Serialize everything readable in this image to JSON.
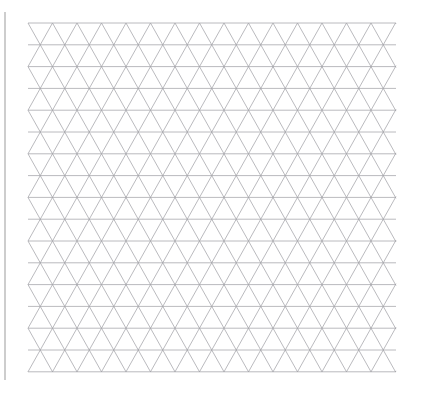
{
  "page": {
    "width": 425,
    "height": 398,
    "background_color": "#ffffff"
  },
  "binding_edge": {
    "name": "page-binding-edge",
    "color": "#b8b8b8",
    "x": 5,
    "y_start": 12,
    "y_end": 380,
    "thickness": 1.4
  },
  "grid": {
    "name": "triangular-grid",
    "type": "isometric-triangular",
    "line_color": "#a3a3a8",
    "line_width": 0.75,
    "left": 28,
    "right": 396,
    "top": 23,
    "bottom": 372,
    "column_spacing": 24.5,
    "row_spacing": 21.8,
    "columns": 16,
    "rows": 17,
    "families": [
      {
        "name": "horizontal-lines",
        "angle_deg": 0
      },
      {
        "name": "diagonal-lines-up",
        "angle_deg": 60
      },
      {
        "name": "diagonal-lines-down",
        "angle_deg": -60
      }
    ]
  }
}
